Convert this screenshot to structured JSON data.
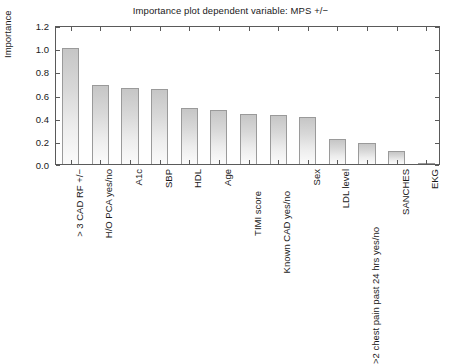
{
  "chart_data": {
    "type": "bar",
    "title": "Importance plot dependent variable: MPS +/−",
    "xlabel": "",
    "ylabel": "Importance",
    "ylim": [
      0.0,
      1.2
    ],
    "grid": false,
    "legend": null,
    "ytick_labels": [
      "1.2",
      "1.0",
      "0.8",
      "0.6",
      "0.4",
      "0.2",
      "0.0"
    ],
    "ytick_values": [
      1.2,
      1.0,
      0.8,
      0.6,
      0.4,
      0.2,
      0.0
    ],
    "categories": [
      "> 3 CAD RF +/−",
      "H/O PCA yes/no",
      "A1c",
      "SBP",
      "HDL",
      "Age",
      "TIMI score",
      "Known CAD yes/no",
      "Sex",
      "LDL level",
      ">2 chest pain past 24 hrs yes/no",
      "SANCHES",
      "EKG"
    ],
    "values": [
      1.0,
      0.685,
      0.66,
      0.645,
      0.48,
      0.47,
      0.43,
      0.42,
      0.41,
      0.215,
      0.18,
      0.115,
      0.005
    ]
  },
  "style": {
    "bar_fill_top": "#c6c6c6",
    "bar_fill_bottom": "#fbfbfb",
    "bar_edge": "#9a9a9a",
    "axis_color": "#5a5a5a",
    "text_color": "#1a1a1a",
    "background": "#ffffff"
  }
}
